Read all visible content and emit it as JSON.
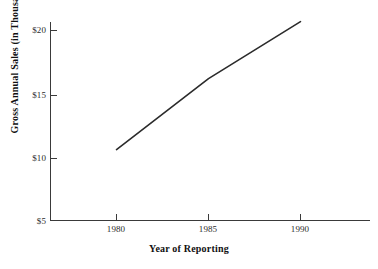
{
  "chart_data": {
    "type": "line",
    "title": "",
    "xlabel": "Year of Reporting",
    "ylabel": "Gross Annual Sales (in Thousands)",
    "x": [
      1980,
      1985,
      1990
    ],
    "values": [
      10.6,
      16.2,
      20.7
    ],
    "series": [
      {
        "name": "Gross Annual Sales",
        "values": [
          10.6,
          16.2,
          20.7
        ]
      }
    ],
    "categories": [
      "1980",
      "1985",
      "1990"
    ],
    "xlim": [
      1980,
      1990
    ],
    "ylim": [
      5,
      20
    ],
    "x_tick_labels": [
      "1980",
      "1985",
      "1990"
    ],
    "y_tick_labels": [
      "$5",
      "$10",
      "$15",
      "$20"
    ],
    "y_tick_values": [
      5,
      10,
      15,
      20
    ],
    "grid": false,
    "legend": "none",
    "line_color": "#2b2b2b"
  },
  "axes": {
    "x_title": "Year of Reporting",
    "y_title": "Gross Annual Sales (in Thousands)",
    "y_ticks": [
      {
        "label": "$20",
        "value": 20
      },
      {
        "label": "$15",
        "value": 15
      },
      {
        "label": "$10",
        "value": 10
      },
      {
        "label": "$5",
        "value": 5
      }
    ],
    "x_ticks": [
      {
        "label": "1980",
        "value": 1980
      },
      {
        "label": "1985",
        "value": 1985
      },
      {
        "label": "1990",
        "value": 1990
      }
    ]
  },
  "colors": {
    "background": "#ffffff",
    "axis": "#3a3a3a",
    "line": "#2b2b2b",
    "text": "#1a1a1a"
  }
}
